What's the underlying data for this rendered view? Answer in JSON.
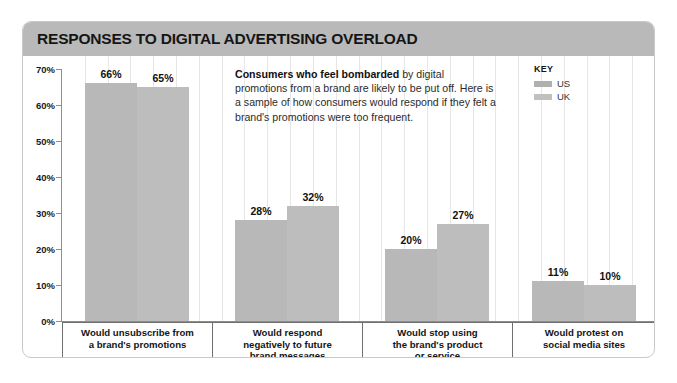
{
  "header": {
    "title": "RESPONSES TO DIGITAL ADVERTISING OVERLOAD"
  },
  "note": {
    "lead": "Consumers who feel bombarded",
    "rest": " by digital promotions from a brand are likely to be put off. Here is a sample of how consumers would respond if they felt a brand's promotions were too frequent."
  },
  "key": {
    "title": "KEY",
    "items": [
      {
        "label": "US",
        "color": "#b0b0b0"
      },
      {
        "label": "UK",
        "color": "#c0c0c0"
      }
    ]
  },
  "yticks": [
    {
      "label": "70%",
      "value": 70
    },
    {
      "label": "60%",
      "value": 60
    },
    {
      "label": "50%",
      "value": 50
    },
    {
      "label": "40%",
      "value": 40
    },
    {
      "label": "30%",
      "value": 30
    },
    {
      "label": "20%",
      "value": 20
    },
    {
      "label": "10%",
      "value": 10
    },
    {
      "label": "0%",
      "value": 0
    }
  ],
  "categories": [
    [
      "Would unsubscribe from",
      "a brand's promotions"
    ],
    [
      "Would respond",
      "negatively to future",
      "brand messages"
    ],
    [
      "Would stop using",
      "the brand's product",
      "or service"
    ],
    [
      "Would protest on",
      "social media sites"
    ]
  ],
  "bar_labels": [
    [
      "66%",
      "65%"
    ],
    [
      "28%",
      "32%"
    ],
    [
      "20%",
      "27%"
    ],
    [
      "11%",
      "10%"
    ]
  ],
  "chart_data": {
    "type": "bar",
    "title": "RESPONSES TO DIGITAL ADVERTISING OVERLOAD",
    "xlabel": "",
    "ylabel": "",
    "ylim": [
      0,
      70
    ],
    "ytick_step": 10,
    "grid": "vertical",
    "legend_position": "top-right",
    "categories": [
      "Would unsubscribe from a brand's promotions",
      "Would respond negatively to future brand messages",
      "Would stop using the brand's product or service",
      "Would protest on social media sites"
    ],
    "series": [
      {
        "name": "US",
        "color": "#b8b8b8",
        "values": [
          66,
          28,
          20,
          11
        ]
      },
      {
        "name": "UK",
        "color": "#bdbdbd",
        "values": [
          65,
          32,
          27,
          10
        ]
      }
    ]
  }
}
